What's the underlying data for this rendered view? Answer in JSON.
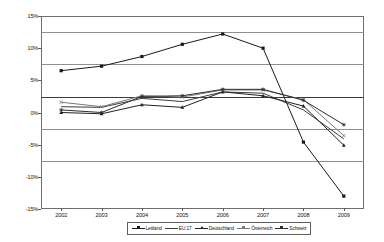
{
  "chart_data": {
    "type": "line",
    "title": "",
    "subtitle": "",
    "xlabel": "",
    "ylabel": "",
    "categories": [
      "2002",
      "2003",
      "2004",
      "2005",
      "2006",
      "2007",
      "2008",
      "2009"
    ],
    "ylim": [
      -15,
      15
    ],
    "ytick_values": [
      15,
      10,
      5,
      0,
      -5,
      -10,
      -15
    ],
    "ytick_labels": [
      "15%",
      "10%",
      "5%",
      "0%",
      "-5%",
      "-10%",
      "-15%"
    ],
    "grid": true,
    "legend_position": "bottom",
    "series": [
      {
        "name": "Lettland",
        "color": "#1a1a1a",
        "marker": "square",
        "values": [
          6.5,
          7.2,
          8.7,
          10.6,
          12.2,
          10.0,
          -4.6,
          -13.0
        ]
      },
      {
        "name": "EU 17",
        "color": "#3d3d3d",
        "marker": "none",
        "values": [
          0.9,
          0.8,
          2.2,
          1.7,
          3.2,
          3.0,
          0.4,
          -4.1
        ]
      },
      {
        "name": "Deutschland",
        "color": "#232323",
        "marker": "triangle",
        "values": [
          0.0,
          -0.2,
          1.2,
          0.8,
          3.2,
          2.6,
          1.0,
          -5.1
        ]
      },
      {
        "name": "Österreich",
        "color": "#7a7a7a",
        "marker": "x",
        "values": [
          1.6,
          0.9,
          2.6,
          2.4,
          3.5,
          3.5,
          2.0,
          -3.6
        ]
      },
      {
        "name": "Schweiz",
        "color": "#2e2e2e",
        "marker": "star",
        "values": [
          0.4,
          0.0,
          2.5,
          2.6,
          3.6,
          3.6,
          1.9,
          -1.9
        ]
      }
    ]
  },
  "legend": {
    "entries": [
      {
        "label": "Lettland"
      },
      {
        "label": "EU 17"
      },
      {
        "label": "Deutschland"
      },
      {
        "label": "Österreich"
      },
      {
        "label": "Schweiz"
      }
    ]
  }
}
